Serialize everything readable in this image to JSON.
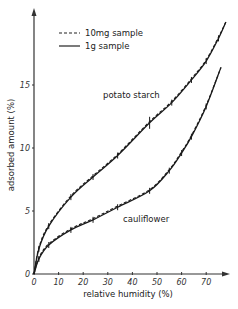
{
  "chart_data": {
    "type": "line",
    "title": "",
    "xlabel": "relative humidity (%)",
    "ylabel": "adsorbed amount (%)",
    "xlim": [
      0,
      80
    ],
    "ylim": [
      0,
      21
    ],
    "x_ticks": [
      0,
      10,
      20,
      30,
      40,
      50,
      60,
      70
    ],
    "y_ticks": [
      0,
      5,
      10,
      15
    ],
    "grid": false,
    "legend": {
      "position": "upper-left",
      "entries": [
        {
          "label": "10mg sample",
          "style": "dashed"
        },
        {
          "label": "1g sample",
          "style": "solid"
        }
      ]
    },
    "series": [
      {
        "name": "potato starch",
        "x": [
          0,
          2,
          6,
          15,
          24,
          34,
          47,
          56,
          64,
          70,
          75,
          78
        ],
        "values": [
          0,
          2.0,
          3.8,
          6.1,
          7.7,
          9.4,
          12.0,
          13.6,
          15.4,
          16.9,
          18.7,
          20.0
        ]
      },
      {
        "name": "cauliflower",
        "x": [
          0,
          2,
          6,
          15,
          24,
          34,
          47,
          55,
          60,
          64,
          70,
          76
        ],
        "values": [
          0,
          1.2,
          2.3,
          3.5,
          4.3,
          5.3,
          6.6,
          8.2,
          9.6,
          10.9,
          13.3,
          16.4
        ]
      }
    ],
    "annotations": [
      "potato starch",
      "cauliflower"
    ]
  },
  "labels": {
    "xlabel": "relative humidity (%)",
    "ylabel": "adsorbed amount (%)",
    "legend_dashed": "10mg sample",
    "legend_solid": "1g sample",
    "series_potato": "potato starch",
    "series_cauliflower": "cauliflower",
    "x_ticks": [
      "0",
      "10",
      "20",
      "30",
      "40",
      "50",
      "60",
      "70"
    ],
    "y_ticks": [
      "0",
      "5",
      "10",
      "15"
    ]
  }
}
